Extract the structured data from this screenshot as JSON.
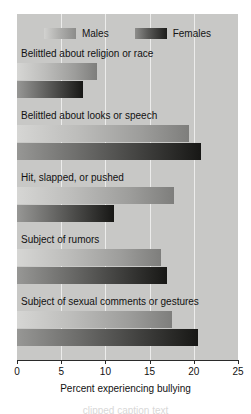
{
  "chart_data": {
    "type": "bar",
    "orientation": "horizontal",
    "title": "",
    "xlabel": "Percent experiencing bullying",
    "ylabel": "",
    "xlim": [
      0,
      25
    ],
    "xticks": [
      0,
      5,
      10,
      15,
      20,
      25
    ],
    "grid": true,
    "legend_position": "top-center",
    "categories": [
      "Belittled about religion or race",
      "Belittled about looks or speech",
      "Hit, slapped, or pushed",
      "Subject of rumors",
      "Subject of sexual comments or gestures"
    ],
    "series": [
      {
        "name": "Males",
        "values": [
          9.0,
          19.5,
          17.8,
          16.3,
          17.5
        ]
      },
      {
        "name": "Females",
        "values": [
          7.5,
          20.8,
          11.0,
          17.0,
          20.5
        ]
      }
    ]
  },
  "legend": {
    "entries": [
      {
        "label": "Males"
      },
      {
        "label": "Females"
      }
    ]
  },
  "axis": {
    "tick_labels": [
      "0",
      "5",
      "10",
      "15",
      "20",
      "25"
    ],
    "title": "Percent experiencing bullying"
  },
  "caption_sliver": "clipped caption text",
  "colors": {
    "panel_background": "#c8c8c6",
    "gridline": "#ececeb",
    "axis": "#2a2a2a",
    "males_light": "#d6d6d4",
    "males_dark": "#7e7e7c",
    "females_light": "#979795",
    "females_dark": "#171715",
    "text": "#111111",
    "figure_background": "#ffffff"
  }
}
